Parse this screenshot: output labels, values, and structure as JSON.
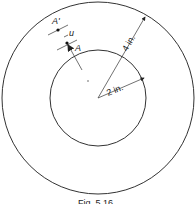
{
  "diagram": {
    "outer_radius_label": "4 in.",
    "inner_radius_label": "2 in.",
    "point_A_label": "A",
    "point_A_prime_label": "A'",
    "displacement_label": "u",
    "caption": "Fig. 5.16"
  }
}
